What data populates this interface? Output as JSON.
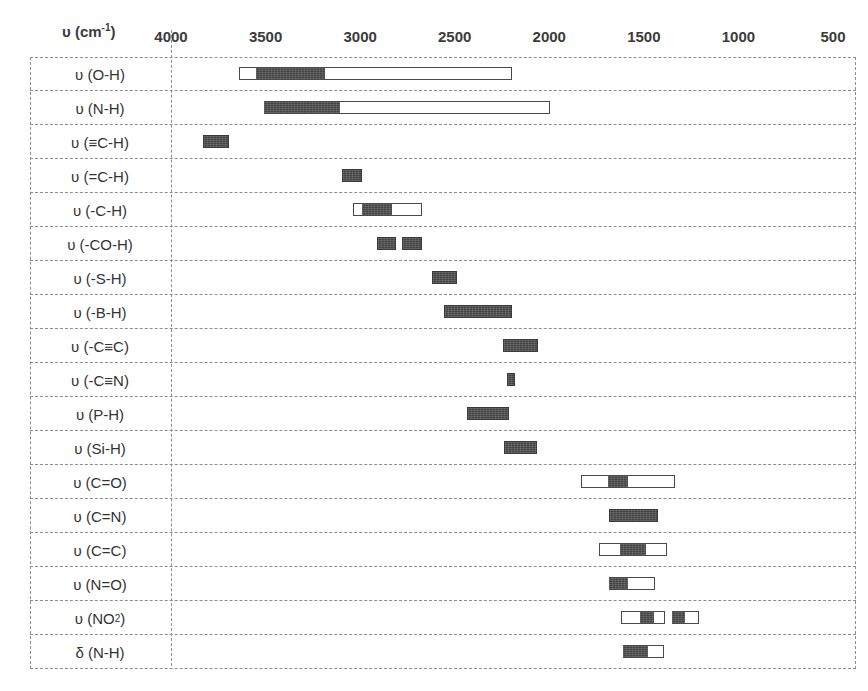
{
  "chart_data": {
    "type": "bar",
    "title": "",
    "subtitle": "",
    "xlabel": "υ (cm⁻¹)",
    "ylabel": "",
    "orientation": "horizontal-range",
    "grid": true,
    "legend": null,
    "xlim": [
      4000,
      500
    ],
    "x_reversed": true,
    "xticks": [
      4000,
      3500,
      3000,
      2500,
      2000,
      1500,
      1000,
      500
    ],
    "xtick_labels": [
      "4000",
      "3500",
      "3000",
      "2500",
      "2000",
      "1500",
      "1000",
      "500"
    ],
    "units": "cm-1",
    "categories": [
      "υ (O-H)",
      "υ (N-H)",
      "υ (≡C-H)",
      "υ (=C-H)",
      "υ (-C-H)",
      "υ (-CO-H)",
      "υ (-S-H)",
      "υ (-B-H)",
      "υ (-C≡C)",
      "υ (-C≡N)",
      "υ (P-H)",
      "υ (Si-H)",
      "υ (C=O)",
      "υ (C=N)",
      "υ (C=C)",
      "υ (N=O)",
      "υ (NO₂)",
      "δ (N-H)"
    ],
    "rows": [
      {
        "label_html": "υ (O-H)",
        "name": "o-h-stretch",
        "bands": [
          {
            "style": "open",
            "from": 3640,
            "to": 2195,
            "fills": [
              {
                "from": 3550,
                "to": 3185
              }
            ]
          }
        ]
      },
      {
        "label_html": "υ (N-H)",
        "name": "n-h-stretch",
        "bands": [
          {
            "style": "open",
            "from": 3510,
            "to": 1995,
            "fills": [
              {
                "from": 3510,
                "to": 3105
              }
            ]
          }
        ]
      },
      {
        "label_html": "υ (≡C-H)",
        "name": "alkyne-c-h-stretch",
        "bands": [
          {
            "style": "solid",
            "from": 3830,
            "to": 3695
          }
        ]
      },
      {
        "label_html": "υ (=C-H)",
        "name": "alkene-c-h-stretch",
        "bands": [
          {
            "style": "solid",
            "from": 3095,
            "to": 2990
          }
        ]
      },
      {
        "label_html": "υ (-C-H)",
        "name": "alkane-c-h-stretch",
        "bands": [
          {
            "style": "open",
            "from": 3040,
            "to": 2675,
            "fills": [
              {
                "from": 2990,
                "to": 2830
              }
            ]
          }
        ]
      },
      {
        "label_html": "υ (-CO-H)",
        "name": "aldehyde-c-h-stretch",
        "bands": [
          {
            "style": "solid",
            "from": 2910,
            "to": 2810
          },
          {
            "style": "solid",
            "from": 2780,
            "to": 2675
          }
        ]
      },
      {
        "label_html": "υ (-S-H)",
        "name": "s-h-stretch",
        "bands": [
          {
            "style": "solid",
            "from": 2620,
            "to": 2490
          }
        ]
      },
      {
        "label_html": "υ (-B-H)",
        "name": "b-h-stretch",
        "bands": [
          {
            "style": "solid",
            "from": 2555,
            "to": 2195
          }
        ]
      },
      {
        "label_html": "υ (-C≡C)",
        "name": "alkyne-c-c-stretch",
        "bands": [
          {
            "style": "solid",
            "from": 2245,
            "to": 2060
          }
        ]
      },
      {
        "label_html": "υ (-C≡N)",
        "name": "nitrile-c-n-stretch",
        "bands": [
          {
            "style": "solid",
            "from": 2225,
            "to": 2180
          }
        ]
      },
      {
        "label_html": "υ (P-H)",
        "name": "p-h-stretch",
        "bands": [
          {
            "style": "solid",
            "from": 2435,
            "to": 2215
          }
        ]
      },
      {
        "label_html": "υ (Si-H)",
        "name": "si-h-stretch",
        "bands": [
          {
            "style": "solid",
            "from": 2240,
            "to": 2065
          }
        ]
      },
      {
        "label_html": "υ (C=O)",
        "name": "carbonyl-stretch",
        "bands": [
          {
            "style": "open",
            "from": 1830,
            "to": 1335,
            "fills": [
              {
                "from": 1690,
                "to": 1585
              }
            ]
          }
        ]
      },
      {
        "label_html": "υ (C=N)",
        "name": "c-n-double-stretch",
        "bands": [
          {
            "style": "solid",
            "from": 1685,
            "to": 1425
          }
        ]
      },
      {
        "label_html": "υ (C=C)",
        "name": "c-c-double-stretch",
        "bands": [
          {
            "style": "open",
            "from": 1735,
            "to": 1375,
            "fills": [
              {
                "from": 1625,
                "to": 1490
              }
            ]
          }
        ]
      },
      {
        "label_html": "υ (N=O)",
        "name": "n-o-double-stretch",
        "bands": [
          {
            "style": "open",
            "from": 1685,
            "to": 1440,
            "fills": [
              {
                "from": 1685,
                "to": 1585
              }
            ]
          }
        ]
      },
      {
        "label_html": "υ (NO₂)",
        "name": "nitro-group-stretch",
        "bands": [
          {
            "style": "open",
            "from": 1620,
            "to": 1390,
            "fills": [
              {
                "from": 1520,
                "to": 1445
              }
            ]
          },
          {
            "style": "open",
            "from": 1350,
            "to": 1210,
            "fills": [
              {
                "from": 1350,
                "to": 1285
              }
            ]
          }
        ]
      },
      {
        "label_html": "δ (N-H)",
        "name": "n-h-bend",
        "bands": [
          {
            "style": "open",
            "from": 1610,
            "to": 1395,
            "fills": [
              {
                "from": 1610,
                "to": 1480
              }
            ]
          }
        ]
      }
    ]
  },
  "axis": {
    "unit_label_prefix": "υ (cm",
    "unit_label_sup": "-1",
    "unit_label_suffix": ")"
  },
  "colors": {
    "bar_fill": "#434343",
    "bar_border": "#4a4a4a",
    "grid_line": "#8d8d8d",
    "text": "#333333",
    "background": "#ffffff"
  }
}
